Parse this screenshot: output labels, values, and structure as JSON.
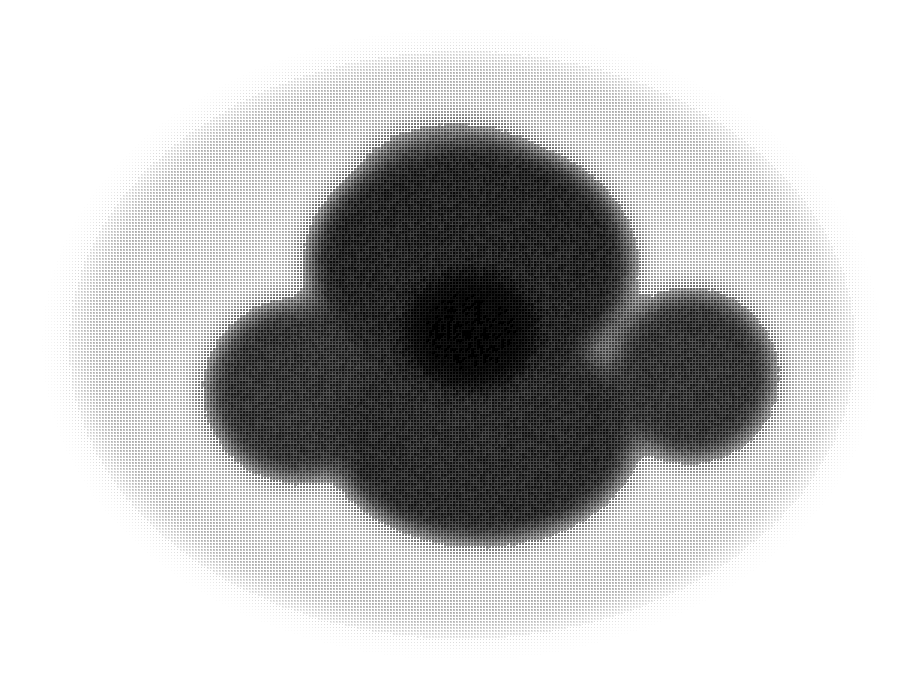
{
  "image": {
    "kind": "halftone-grayscale-scan",
    "modality_appearance": "axial cross-section tomographic scan",
    "width": 918,
    "height": 693,
    "background_color": "#ffffff",
    "ink_color": "#000000",
    "caption": "",
    "labels": [],
    "annotations": [],
    "visible_text": ""
  },
  "halftone": {
    "pattern": "orthogonal square-dot screen",
    "pitch_px": 3,
    "dot_shape": "square",
    "angle_deg": 0,
    "min_coverage_pct": 0,
    "max_coverage_pct": 52
  },
  "render": {
    "noise_amount": 0.06,
    "edge_softness_px": 26,
    "supersample": 1
  },
  "chart_data": {
    "type": "heatmap",
    "title": "",
    "xlabel": "",
    "ylabel": "",
    "grid": false,
    "legend": "none",
    "xlim": [
      0,
      918
    ],
    "ylim": [
      0,
      693
    ],
    "colormap": "grayscale-inverted",
    "value_range": [
      0.0,
      1.0
    ],
    "regions": [
      {
        "name": "background",
        "shape": "rectangle",
        "intensity": 0.0,
        "bounds": [
          0,
          0,
          918,
          693
        ]
      },
      {
        "name": "outer-body-ellipse",
        "shape": "ellipse",
        "intensity": 0.19,
        "cx": 462,
        "cy": 345,
        "rx": 408,
        "ry": 305,
        "feather": 40
      },
      {
        "name": "inner-dark-mass",
        "shape": "blob",
        "intensity": 0.52,
        "feather": 30,
        "lobes": [
          {
            "cx": 470,
            "cy": 265,
            "rx": 180,
            "ry": 140,
            "weight": 1.0
          },
          {
            "cx": 300,
            "cy": 390,
            "rx": 110,
            "ry": 105,
            "weight": 0.95
          },
          {
            "cx": 690,
            "cy": 375,
            "rx": 100,
            "ry": 100,
            "weight": 0.95
          },
          {
            "cx": 480,
            "cy": 430,
            "rx": 175,
            "ry": 125,
            "weight": 0.98
          },
          {
            "cx": 455,
            "cy": 180,
            "rx": 120,
            "ry": 70,
            "weight": 0.8
          }
        ]
      },
      {
        "name": "dark-core-accent",
        "shape": "ellipse",
        "intensity": 0.6,
        "cx": 470,
        "cy": 330,
        "rx": 120,
        "ry": 105,
        "feather": 70
      }
    ],
    "extents": {
      "outer_body": {
        "x_min": 55,
        "x_max": 868,
        "y_min": 42,
        "y_max": 650
      },
      "inner_mass": {
        "x_min": 215,
        "x_max": 765,
        "y_min": 135,
        "y_max": 572
      }
    }
  }
}
